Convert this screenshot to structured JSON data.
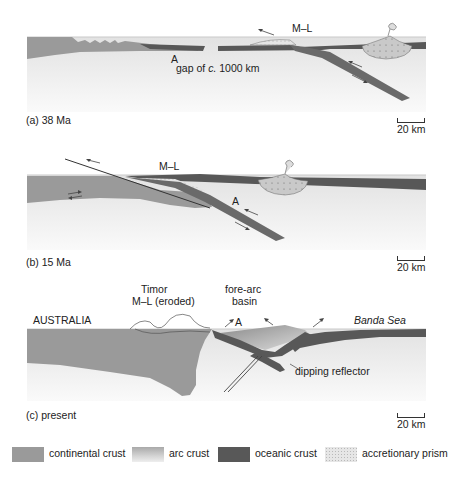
{
  "figure": {
    "panels": [
      {
        "id": "a",
        "caption": "(a) 38 Ma",
        "scale": "20 km",
        "labels": {
          "ml": "M–L",
          "a": "A",
          "gap_prefix": "gap of ",
          "gap_italic": "c.",
          "gap_suffix": " 1000 km"
        }
      },
      {
        "id": "b",
        "caption": "(b) 15 Ma",
        "scale": "20 km",
        "labels": {
          "ml": "M–L",
          "a": "A"
        }
      },
      {
        "id": "c",
        "caption": "(c)  present",
        "scale": "20 km",
        "labels": {
          "timor": "Timor",
          "ml_eroded": "M–L (eroded)",
          "forearc_1": "fore-arc",
          "forearc_2": "basin",
          "australia": "AUSTRALIA",
          "a": "A",
          "banda_sea": "Banda Sea",
          "dipping_reflector": "dipping reflector"
        }
      }
    ],
    "legend": [
      {
        "key": "continental",
        "label": "continental crust",
        "color": "#9a9a9a"
      },
      {
        "key": "arc",
        "label": "arc crust",
        "color": "#c8c8c8"
      },
      {
        "key": "oceanic",
        "label": "oceanic crust",
        "color": "#585858"
      },
      {
        "key": "accretionary",
        "label": "accretionary prism",
        "color": "#e6e6e6"
      }
    ],
    "colors": {
      "mantle": "#e6e6e6",
      "sea_line": "#bfbfbf",
      "continental": "#9a9a9a",
      "oceanic": "#585858",
      "arc": "#c8c8c8"
    }
  }
}
